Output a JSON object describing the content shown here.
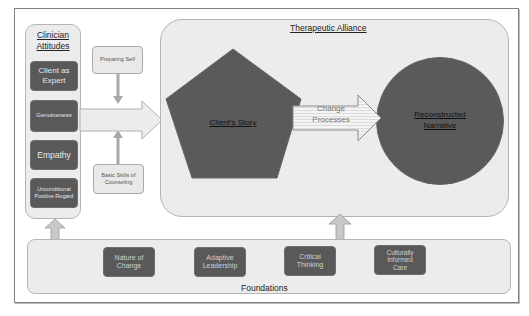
{
  "diagram": {
    "clinician_attitudes": {
      "title_line1": "Clinician",
      "title_line2": "Attitudes",
      "items": [
        {
          "label": "Client as Expert"
        },
        {
          "label": "Genuineness"
        },
        {
          "label": "Empathy"
        },
        {
          "label": "Unconditional Positive Regard"
        }
      ]
    },
    "side_boxes": {
      "top": "Preparing Self",
      "bottom": "Basic Skills of Counseling"
    },
    "therapeutic_alliance": {
      "title": "Therapeutic Alliance",
      "pentagon_label": "Client's Story",
      "arrow_label_line1": "Change",
      "arrow_label_line2": "Processes",
      "circle_label_line1": "Reconstructed",
      "circle_label_line2": "Narrative"
    },
    "foundations": {
      "title": "Foundations",
      "items": [
        {
          "line1": "Nature of",
          "line2": "Change"
        },
        {
          "line1": "Adaptive",
          "line2": "Leadership"
        },
        {
          "line1": "Critical",
          "line2": "Thinking"
        },
        {
          "line1": "Culturally",
          "line2": "Informed",
          "line3": "Care"
        }
      ]
    },
    "colors": {
      "dark_fill": "#595959",
      "light_fill": "#ececec",
      "border": "#b5b5b5",
      "frame": "#7f7f7f"
    }
  }
}
